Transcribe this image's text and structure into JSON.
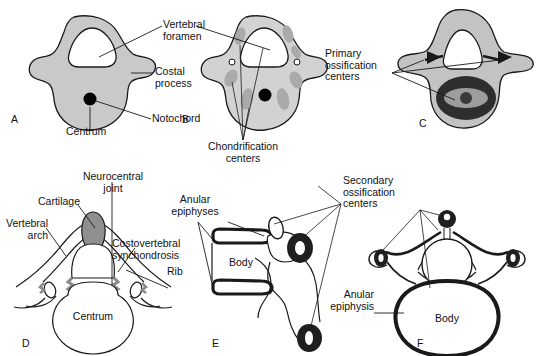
{
  "figure": {
    "type": "anatomical-diagram",
    "panel_count": 6,
    "colors": {
      "mesenchyme_fill": "#c9c9c9",
      "cartilage_fill": "#9a9a9a",
      "chondrification_fill": "#a8a8a8",
      "ossification_dark": "#2b2b2b",
      "ossification_mid": "#555555",
      "notochord": "#000000",
      "outline": "#1a1a1a",
      "background": "#ffffff"
    }
  },
  "panels": [
    {
      "letter": "A",
      "name": "mesenchymal-vertebra",
      "labels": [
        {
          "text": "Vertebral\nforamen",
          "name": "label-vertebral-foramen"
        },
        {
          "text": "Costal\nprocess",
          "name": "label-costal-process"
        },
        {
          "text": "Notochord",
          "name": "label-notochord"
        },
        {
          "text": "Centrum",
          "name": "label-centrum"
        }
      ]
    },
    {
      "letter": "B",
      "name": "chondrification-vertebra",
      "labels": [
        {
          "text": "Chondrification\ncenters",
          "name": "label-chondrification-centers"
        }
      ]
    },
    {
      "letter": "C",
      "name": "primary-ossification-vertebra",
      "labels": [
        {
          "text": "Primary\nossification\ncenters",
          "name": "label-primary-ossification-centers"
        }
      ]
    },
    {
      "letter": "D",
      "name": "cartilaginous-vertebra-superior-view",
      "labels": [
        {
          "text": "Neurocentral\njoint",
          "name": "label-neurocentral-joint"
        },
        {
          "text": "Cartilage",
          "name": "label-cartilage"
        },
        {
          "text": "Vertebral\narch",
          "name": "label-vertebral-arch"
        },
        {
          "text": "Costovertebral\nsynchondrosis",
          "name": "label-costovertebral-synchondrosis"
        },
        {
          "text": "Rib",
          "name": "label-rib"
        },
        {
          "text": "Centrum",
          "name": "label-centrum-d"
        }
      ]
    },
    {
      "letter": "E",
      "name": "vertebra-lateral-view-secondary-centers",
      "labels": [
        {
          "text": "Anular\nepiphyses",
          "name": "label-anular-epiphyses"
        },
        {
          "text": "Body",
          "name": "label-body-e"
        },
        {
          "text": "Secondary\nossification\ncenters",
          "name": "label-secondary-ossification-centers"
        }
      ]
    },
    {
      "letter": "F",
      "name": "mature-vertebra-superior-view",
      "labels": [
        {
          "text": "Anular\nepiphysis",
          "name": "label-anular-epiphysis"
        },
        {
          "text": "Body",
          "name": "label-body-f"
        }
      ]
    }
  ],
  "text": {
    "vertebral_foramen_l1": "Vertebral",
    "vertebral_foramen_l2": "foramen",
    "costal_process_l1": "Costal",
    "costal_process_l2": "process",
    "notochord": "Notochord",
    "centrum_a": "Centrum",
    "chondrification_l1": "Chondrification",
    "chondrification_l2": "centers",
    "primary_l1": "Primary",
    "primary_l2": "ossification",
    "primary_l3": "centers",
    "neurocentral_l1": "Neurocentral",
    "neurocentral_l2": "joint",
    "cartilage": "Cartilage",
    "vertebral_arch_l1": "Vertebral",
    "vertebral_arch_l2": "arch",
    "costovertebral_l1": "Costovertebral",
    "costovertebral_l2": "synchondrosis",
    "rib": "Rib",
    "centrum_d": "Centrum",
    "anular_epiphyses_l1": "Anular",
    "anular_epiphyses_l2": "epiphyses",
    "body_e": "Body",
    "secondary_l1": "Secondary",
    "secondary_l2": "ossification",
    "secondary_l3": "centers",
    "anular_epiphysis_l1": "Anular",
    "anular_epiphysis_l2": "epiphysis",
    "body_f": "Body",
    "letter_a": "A",
    "letter_b": "B",
    "letter_c": "C",
    "letter_d": "D",
    "letter_e": "E",
    "letter_f": "F"
  }
}
